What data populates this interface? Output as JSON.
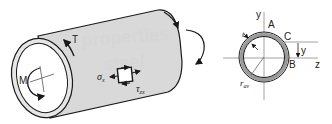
{
  "diagram": {
    "colors": {
      "tube_fill": "#d9d9d9",
      "tube_stroke": "#1a1a1a",
      "section_ring": "#9a9a9a",
      "axis": "#8c8c8c",
      "watermark": "#d6d6d6"
    },
    "tube": {
      "labels": {
        "torque": "T",
        "moment": "M",
        "normal_stress": "σ",
        "normal_stress_sub": "x",
        "shear_stress": "τ",
        "shear_stress_sub": "zx"
      }
    },
    "watermark": {
      "line1": "properties",
      "line2": "steel"
    },
    "cross_section": {
      "axis_y": "y",
      "axis_z": "z",
      "point_a": "A",
      "point_b": "B",
      "point_c": "C",
      "dimension_y": "y",
      "thickness": "t",
      "radius": "r",
      "radius_sub": "av"
    }
  }
}
